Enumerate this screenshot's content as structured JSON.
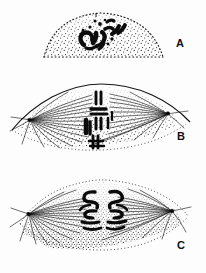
{
  "figure": {
    "style": "stippled ink line drawing, black on white",
    "background_color": "#fdfdfd",
    "ink_color": "#111111",
    "width": 206,
    "height": 273
  },
  "panels": [
    {
      "id": "A",
      "label": "A",
      "stage": "prophase",
      "description": "dome shaped cell outlined with stipple dots, condensed chromosomes clustered as dark blobs near the centre",
      "label_x": 176,
      "label_y": 38,
      "cell_shape": "dome",
      "has_spindle": false,
      "chromosome_count": 8
    },
    {
      "id": "B",
      "label": "B",
      "stage": "metaphase",
      "description": "lens shaped cell with bipolar spindle, chromosomes aligned in a column at the equator, centrioles as dots at each pole",
      "label_x": 177,
      "label_y": 131,
      "cell_shape": "spindle",
      "has_spindle": true,
      "chromosome_count": 8
    },
    {
      "id": "C",
      "label": "C",
      "stage": "anaphase",
      "description": "lens shaped cell with spindle, V shaped chromatids pulled apart toward opposite poles",
      "label_x": 177,
      "label_y": 240,
      "cell_shape": "spindle",
      "has_spindle": true,
      "chromosome_count": 8
    }
  ]
}
